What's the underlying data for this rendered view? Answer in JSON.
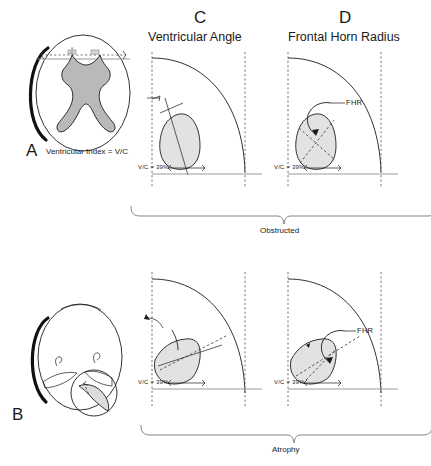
{
  "figure": {
    "title_text": "",
    "panels": {
      "a": {
        "letter": "A",
        "caption": "Ventricular Index = V/C",
        "inner_labels": {
          "numerator": "V",
          "denominator": "C"
        }
      },
      "b": {
        "letter": "B",
        "caption": ""
      },
      "c": {
        "letter": "C",
        "title": "Ventricular Angle"
      },
      "d": {
        "letter": "D",
        "title": "Frontal Horn Radius"
      }
    },
    "rows": [
      {
        "bracket_label": "Obstructed"
      },
      {
        "bracket_label": "Atrophy"
      }
    ],
    "annotations": {
      "vc_value": "V/C = 39%",
      "fhr": "FHR"
    },
    "colors": {
      "ink": "#1a1a1a",
      "shade": "#e2e2e2",
      "ventricle": "#b9b9b9",
      "guide": "#555555",
      "gray_line": "#9a9a9a",
      "background": "#ffffff"
    }
  }
}
